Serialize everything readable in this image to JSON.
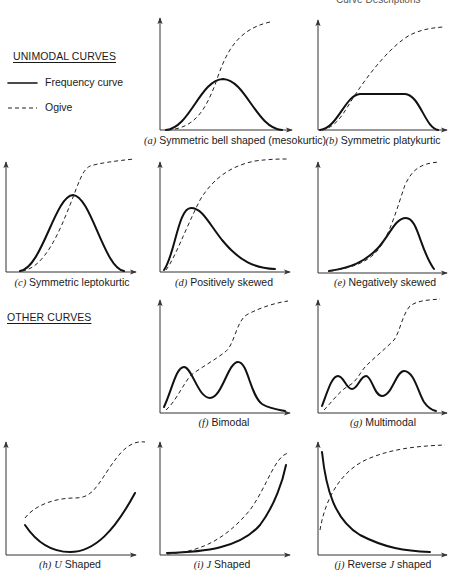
{
  "header": {
    "cut_text": "Curve Descriptions"
  },
  "sections": {
    "unimodal": "UNIMODAL CURVES",
    "other": "OTHER CURVES"
  },
  "legend": {
    "frequency": "Frequency curve",
    "ogive": "Ogive"
  },
  "panels": [
    {
      "tag": "(a)",
      "label": "Symmetric bell shaped (mesokurtic)"
    },
    {
      "tag": "(b)",
      "label": "Symmetric platykurtic"
    },
    {
      "tag": "(c)",
      "label": "Symmetric leptokurtic"
    },
    {
      "tag": "(d)",
      "label": "Positively skewed"
    },
    {
      "tag": "(e)",
      "label": "Negatively skewed"
    },
    {
      "tag": "(f)",
      "label": "Bimodal"
    },
    {
      "tag": "(g)",
      "label": "Multimodal"
    },
    {
      "tag": "(h)",
      "tag_letter": "U",
      "label": "Shaped"
    },
    {
      "tag": "(i)",
      "tag_letter": "J",
      "label": "Shaped"
    },
    {
      "tag": "(j)",
      "pre": "Reverse",
      "tag_letter": "J",
      "label": "shaped"
    }
  ],
  "colors": {
    "ink": "#111111",
    "axis": "#333333",
    "background": "#ffffff"
  }
}
